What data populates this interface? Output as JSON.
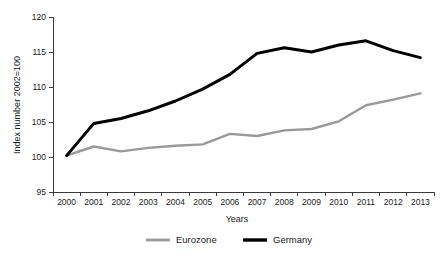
{
  "chart_data": {
    "type": "line",
    "title": "",
    "xlabel": "Years",
    "ylabel": "Index number 2002=100",
    "categories": [
      "2000",
      "2001",
      "2002",
      "2003",
      "2004",
      "2005",
      "2006",
      "2007",
      "2008",
      "2009",
      "2010",
      "2011",
      "2012",
      "2013"
    ],
    "x": [
      2000,
      2001,
      2002,
      2003,
      2004,
      2005,
      2006,
      2007,
      2008,
      2009,
      2010,
      2011,
      2012,
      2013
    ],
    "xlim": [
      2000,
      2013
    ],
    "ylim": [
      95,
      120
    ],
    "yticks": [
      95,
      100,
      105,
      110,
      115,
      120
    ],
    "xticks": [
      "2000",
      "2001",
      "2002",
      "2003",
      "2004",
      "2005",
      "2006",
      "2007",
      "2008",
      "2009",
      "2010",
      "2011",
      "2012",
      "2013"
    ],
    "grid": false,
    "legend_position": "bottom",
    "series": [
      {
        "name": "Eurozone",
        "color": "#999999",
        "values": [
          100.2,
          101.5,
          100.8,
          101.3,
          101.6,
          101.8,
          103.3,
          103.0,
          103.8,
          104.0,
          105.1,
          107.4,
          108.2,
          109.1
        ]
      },
      {
        "name": "Germany",
        "color": "#000000",
        "values": [
          100.2,
          104.8,
          105.5,
          106.6,
          108.0,
          109.7,
          111.8,
          114.8,
          115.6,
          115.0,
          116.0,
          116.6,
          115.2,
          114.2
        ]
      }
    ]
  },
  "legend": {
    "items": [
      {
        "label": "Eurozone",
        "color": "#999999"
      },
      {
        "label": "Germany",
        "color": "#000000"
      }
    ]
  },
  "axes": {
    "y_title": "Index number 2002=100",
    "x_title": "Years"
  }
}
